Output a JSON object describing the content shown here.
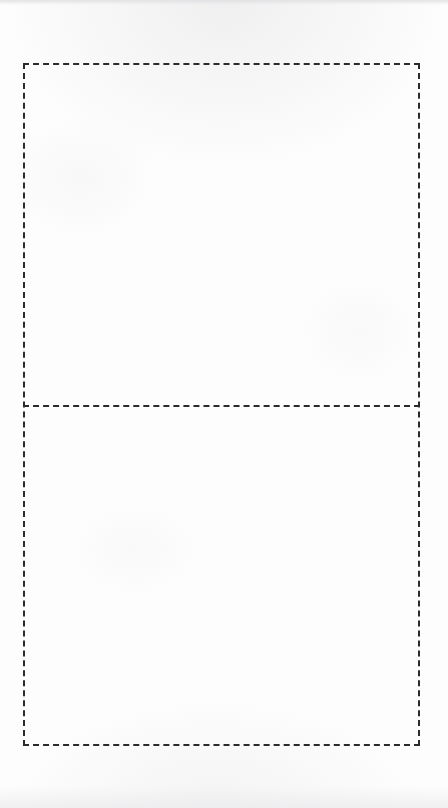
{
  "document": {
    "kind": "worksheet",
    "title": "",
    "background_color": "#fdfdfd",
    "page_width": 448,
    "page_height": 808
  },
  "table": {
    "name": "two-cell-dashed-table",
    "border_style": "dashed",
    "border_color": "#2b2b2b",
    "border_width_px": 2,
    "dash_length_px": 11,
    "dash_gap_px": 5,
    "left_px": 23,
    "top_px": 63,
    "right_px": 420,
    "bottom_px": 746,
    "width_px": 397,
    "height_px": 683,
    "column_count": 1,
    "row_count": 2,
    "divider_y_px": 405,
    "rows": [
      {
        "name": "upper-cell",
        "label": "",
        "text": "",
        "is_blank": true
      },
      {
        "name": "lower-cell",
        "label": "",
        "text": "",
        "is_blank": true
      }
    ]
  },
  "annotations": {
    "header_text": "",
    "footer_text": "",
    "page_number": ""
  }
}
